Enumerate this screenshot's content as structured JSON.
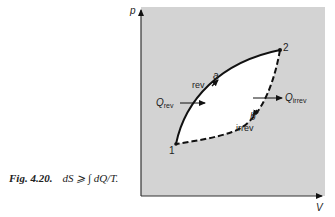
{
  "figure": {
    "label": "Fig. 4.20.",
    "caption": "dS ⩾ ∫ dQ/T.",
    "panel_color": "#d3d3d3",
    "region_color": "#ffffff"
  },
  "axes": {
    "y_label": "p",
    "x_label": "V"
  },
  "points": [
    {
      "id": "1",
      "label": "1"
    },
    {
      "id": "2",
      "label": "2"
    }
  ],
  "paths": {
    "rev": {
      "label": "rev",
      "marker": "a",
      "style": "solid"
    },
    "irrev": {
      "label": "irrev",
      "marker": "b",
      "style": "dashed"
    }
  },
  "heat": {
    "rev": {
      "symbol": "Q",
      "subscript": "rev"
    },
    "irrev": {
      "symbol": "Q",
      "subscript": "irrev"
    }
  }
}
